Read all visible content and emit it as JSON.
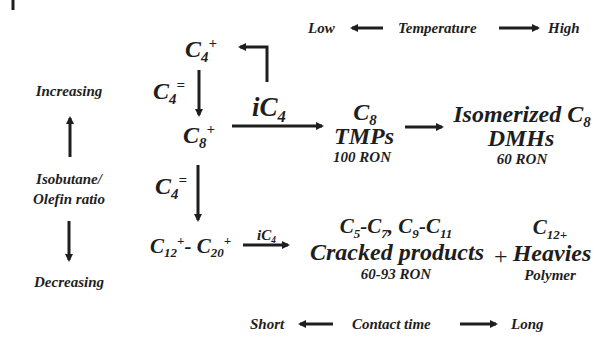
{
  "temperature_axis": {
    "low": "Low",
    "label": "Temperature",
    "high": "High"
  },
  "contact_time_axis": {
    "low": "Short",
    "label": "Contact time",
    "high": "Long"
  },
  "ratio_axis": {
    "top": "Increasing",
    "label_line1": "Isobutane/",
    "label_line2": "Olefin ratio",
    "bottom": "Decreasing"
  },
  "species": {
    "c4_plus": {
      "base": "C",
      "sub": "4",
      "sup": "+"
    },
    "c4_olefin_1": {
      "base": "C",
      "sub": "4",
      "sup": "="
    },
    "c8_plus": {
      "base": "C",
      "sub": "8",
      "sup": "+"
    },
    "c4_olefin_2": {
      "base": "C",
      "sub": "4",
      "sup": "="
    },
    "ic4_main": {
      "prefix": "i",
      "base": "C",
      "sub": "4"
    },
    "c12_c20": {
      "a_base": "C",
      "a_sub": "12",
      "a_sup": "+",
      "dash": "- ",
      "b_base": "C",
      "b_sub": "20",
      "b_sup": "+"
    },
    "ic4_small": {
      "prefix": "i",
      "base": "C",
      "sub": "4"
    }
  },
  "products": {
    "tmp": {
      "formula_base": "C",
      "formula_sub": "8",
      "name": "TMPs",
      "ron": "100 RON"
    },
    "dmh": {
      "name_prefix": "Isomerized ",
      "formula_base": "C",
      "formula_sub": "8",
      "name": "DMHs",
      "ron": "60 RON"
    },
    "cracked": {
      "f1": "C",
      "s1": "5",
      "d1": "-",
      "f2": "C",
      "s2": "7",
      "comma": ", ",
      "f3": "C",
      "s3": "9",
      "d2": "-",
      "f4": "C",
      "s4": "11",
      "name": "Cracked products",
      "ron": "60-93 RON"
    },
    "plus": "+",
    "heavies": {
      "formula_base": "C",
      "formula_sub": "12+",
      "name": "Heavies",
      "note": "Polymer"
    }
  },
  "colors": {
    "ink": "#1e1e1e",
    "background": "#ffffff"
  }
}
